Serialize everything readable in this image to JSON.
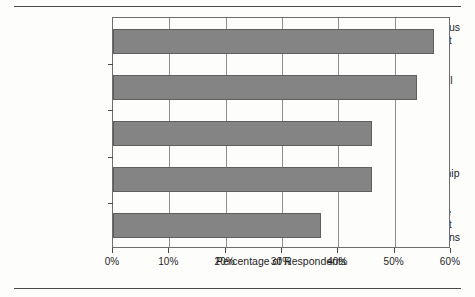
{
  "chart_data": {
    "type": "bar",
    "orientation": "horizontal",
    "title": "",
    "subtitle": "",
    "xlabel": "Percentage of Respondents",
    "ylabel": "",
    "categories": [
      "Joint Continuous Improvement Objectives",
      "Service Level Agreements",
      "Site Visits",
      "Joint Leadership Meetings",
      "Performance Management Communications"
    ],
    "category_lines": [
      [
        "Joint Continuous",
        "Improvement",
        "Objectives"
      ],
      [
        "Service Level",
        "Agreements"
      ],
      [
        "Site Visits"
      ],
      [
        "Joint Leadership",
        "Meetings"
      ],
      [
        "Performance",
        "Management",
        "Communications"
      ]
    ],
    "values": [
      57,
      54,
      46,
      46,
      37
    ],
    "xlim": [
      0,
      60
    ],
    "xticks": [
      0,
      10,
      20,
      30,
      40,
      50,
      60
    ],
    "xticklabels": [
      "0%",
      "10%",
      "20%",
      "30%",
      "40%",
      "50%",
      "60%"
    ],
    "grid": true,
    "grid_axis": "x",
    "legend": null,
    "bar_color": "#848484",
    "bar_edge_color": "#5f5f5f",
    "axis_color": "#6e6e6e",
    "grid_color": "#8d8d8d",
    "text_color": "#1f1f1f",
    "background_color": "#fdfdfc"
  }
}
